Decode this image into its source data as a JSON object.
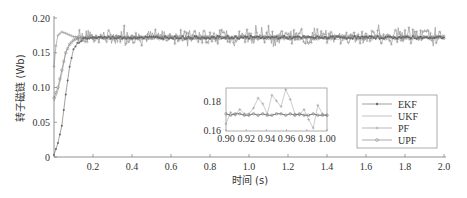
{
  "chart_data": {
    "type": "line",
    "title": "",
    "xlabel": "时间 (s)",
    "ylabel": "转子磁链 (Wb)",
    "xlim": [
      0,
      2.0
    ],
    "ylim": [
      0,
      0.2
    ],
    "xticks": [
      "0.2",
      "0.4",
      "0.6",
      "0.8",
      "1.0",
      "1.2",
      "1.4",
      "1.6",
      "1.8",
      "2.0"
    ],
    "yticks": [
      "0",
      "0.05",
      "0.10",
      "0.15",
      "0.20"
    ],
    "grid": false,
    "legend_position": "right-center",
    "steady_state": 0.172,
    "series": [
      {
        "name": "EKF",
        "marker": "*",
        "rise_time_s": 0.16,
        "x": [
          0,
          0.02,
          0.04,
          0.06,
          0.08,
          0.1,
          0.12,
          0.14,
          0.16,
          0.2
        ],
        "values": [
          0.003,
          0.02,
          0.045,
          0.09,
          0.13,
          0.155,
          0.163,
          0.168,
          0.171,
          0.172
        ],
        "noise": 0.002
      },
      {
        "name": "UKF",
        "marker": ".",
        "rise_time_s": 0.12,
        "x": [
          0,
          0.02,
          0.04,
          0.06,
          0.08,
          0.1,
          0.12,
          0.2
        ],
        "values": [
          0.08,
          0.095,
          0.12,
          0.15,
          0.163,
          0.168,
          0.171,
          0.172
        ],
        "noise": 0.004
      },
      {
        "name": "PF",
        "marker": "+",
        "rise_time_s": 0.04,
        "x": [
          0,
          0.01,
          0.02,
          0.04,
          0.06,
          0.1
        ],
        "values": [
          0.13,
          0.16,
          0.175,
          0.18,
          0.178,
          0.173
        ],
        "noise": 0.01
      },
      {
        "name": "UPF",
        "marker": "o",
        "rise_time_s": 0.12,
        "x": [
          0,
          0.02,
          0.04,
          0.06,
          0.08,
          0.1,
          0.12,
          0.2
        ],
        "values": [
          0.085,
          0.1,
          0.125,
          0.15,
          0.162,
          0.168,
          0.171,
          0.172
        ],
        "noise": 0.002
      }
    ],
    "inset": {
      "xlim": [
        0.9,
        1.0
      ],
      "ylim": [
        0.16,
        0.19
      ],
      "xticks": [
        "0.90",
        "0.92",
        "0.94",
        "0.96",
        "0.98",
        "1.00"
      ],
      "yticks": [
        "0.16",
        "0.18"
      ],
      "pf_values": [
        0.165,
        0.173,
        0.171,
        0.175,
        0.172,
        0.172,
        0.176,
        0.183,
        0.179,
        0.172,
        0.185,
        0.181,
        0.177,
        0.189,
        0.182,
        0.172,
        0.171,
        0.175,
        0.168,
        0.162,
        0.178,
        0.172,
        0.171
      ],
      "ekf_values": [
        0.172,
        0.171,
        0.172,
        0.172,
        0.171,
        0.171,
        0.172,
        0.171,
        0.172,
        0.171,
        0.171,
        0.172,
        0.172,
        0.171,
        0.172,
        0.171,
        0.172,
        0.171,
        0.171,
        0.172,
        0.171,
        0.171,
        0.171
      ]
    }
  },
  "legend": {
    "items": [
      "EKF",
      "UKF",
      "PF",
      "UPF"
    ]
  }
}
